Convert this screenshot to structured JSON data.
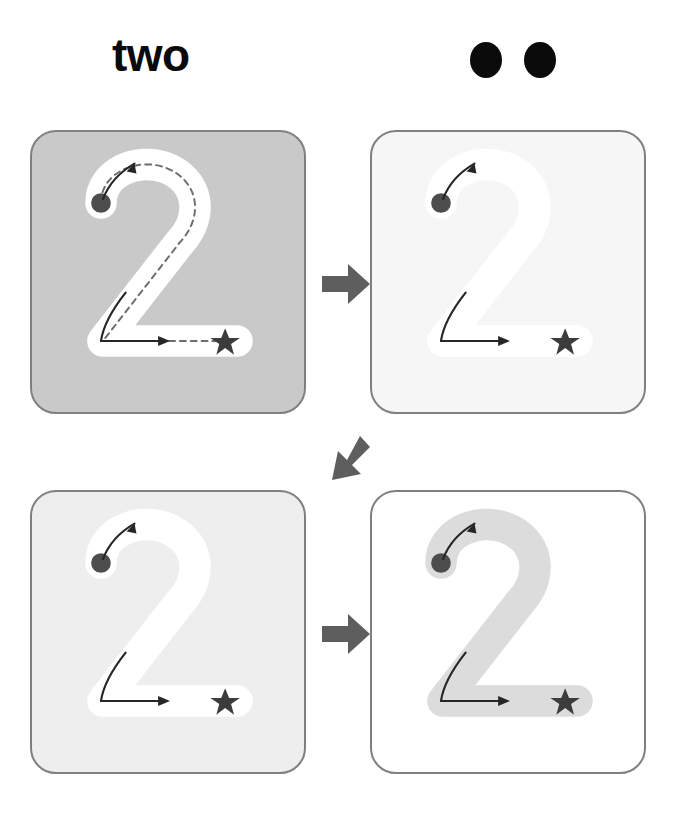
{
  "worksheet": {
    "title_word": "two",
    "numeral": "2",
    "count": 2,
    "count_dot_color": "#0b0b0b",
    "page_background": "#ffffff"
  },
  "header": {
    "word_label": "two",
    "dots": [
      {
        "name": "count-dot-1",
        "color": "#0b0b0b"
      },
      {
        "name": "count-dot-2",
        "color": "#0b0b0b"
      }
    ]
  },
  "cards": [
    {
      "id": "card-1",
      "step": 1,
      "label": "trace-with-guide",
      "card_background": "#c9c9c9",
      "border_color": "#808080",
      "numeral_color": "#ffffff",
      "numeral": "2",
      "has_dashed_guide": true,
      "dashed_guide_color": "#6d6d6d",
      "start_dot_color": "#4d4d4d",
      "end_star_color": "#3c3c3c",
      "stroke_arrow_color": "#262626"
    },
    {
      "id": "card-2",
      "step": 2,
      "label": "trace-faded",
      "card_background": "#f6f6f6",
      "border_color": "#808080",
      "numeral_color": "#ffffff",
      "numeral": "2",
      "has_dashed_guide": false,
      "start_dot_color": "#4d4d4d",
      "end_star_color": "#3c3c3c",
      "stroke_arrow_color": "#262626"
    },
    {
      "id": "card-3",
      "step": 3,
      "label": "trace-lighter",
      "card_background": "#eeeeee",
      "border_color": "#808080",
      "numeral_color": "#ffffff",
      "numeral": "2",
      "has_dashed_guide": false,
      "start_dot_color": "#4d4d4d",
      "end_star_color": "#3c3c3c",
      "stroke_arrow_color": "#262626"
    },
    {
      "id": "card-4",
      "step": 4,
      "label": "write-independently",
      "card_background": "#ffffff",
      "border_color": "#808080",
      "numeral_color": "#dcdcdc",
      "numeral": "2",
      "has_dashed_guide": false,
      "start_dot_color": "#4d4d4d",
      "end_star_color": "#3c3c3c",
      "stroke_arrow_color": "#262626"
    }
  ],
  "flow_arrows": [
    {
      "id": "arrow-right-top",
      "direction": "right",
      "color": "#5e5e5e",
      "from": "card-1",
      "to": "card-2"
    },
    {
      "id": "arrow-diagonal",
      "direction": "down-left",
      "color": "#5e5e5e",
      "from": "card-2",
      "to": "card-3"
    },
    {
      "id": "arrow-right-bottom",
      "direction": "right",
      "color": "#5e5e5e",
      "from": "card-3",
      "to": "card-4"
    }
  ]
}
